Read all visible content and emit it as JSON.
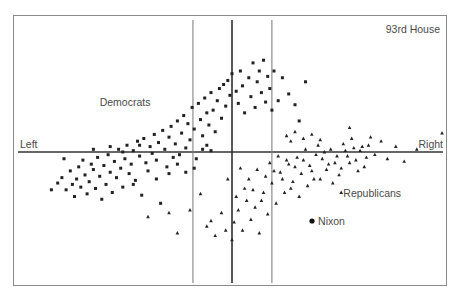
{
  "chart_data": {
    "type": "scatter",
    "title": "93rd House",
    "xlabel_left": "Left",
    "xlabel_right": "Right",
    "xlim": [
      -1,
      1
    ],
    "ylim": [
      -1,
      1
    ],
    "grid": false,
    "axis_lines": {
      "horizontal_y": 0,
      "vertical_center_x": 0,
      "vertical_guides_x": [
        -0.186,
        0.19
      ]
    },
    "annotations": [
      {
        "text": "Democrats",
        "x": -0.63,
        "y": 0.34
      },
      {
        "text": "Republicans",
        "x": 0.53,
        "y": -0.33
      },
      {
        "text": "Nixon",
        "x": 0.41,
        "y": -0.54
      }
    ],
    "special_points": [
      {
        "name": "Nixon",
        "x": 0.381,
        "y": -0.511,
        "marker": "circle"
      }
    ],
    "series": [
      {
        "name": "Democrats",
        "marker": "square",
        "points": [
          [
            -0.83,
            -0.23
          ],
          [
            -0.81,
            -0.19
          ],
          [
            -0.79,
            -0.28
          ],
          [
            -0.77,
            -0.14
          ],
          [
            -0.75,
            -0.33
          ],
          [
            -0.74,
            -0.2
          ],
          [
            -0.73,
            -0.11
          ],
          [
            -0.72,
            -0.26
          ],
          [
            -0.71,
            -0.06
          ],
          [
            -0.7,
            -0.17
          ],
          [
            -0.69,
            -0.31
          ],
          [
            -0.68,
            -0.22
          ],
          [
            -0.67,
            -0.09
          ],
          [
            -0.66,
            -0.13
          ],
          [
            -0.65,
            -0.27
          ],
          [
            -0.64,
            -0.04
          ],
          [
            -0.63,
            -0.18
          ],
          [
            -0.62,
            -0.35
          ],
          [
            -0.61,
            -0.1
          ],
          [
            -0.6,
            -0.24
          ],
          [
            -0.59,
            -0.02
          ],
          [
            -0.58,
            -0.15
          ],
          [
            -0.57,
            -0.3
          ],
          [
            -0.56,
            -0.07
          ],
          [
            -0.55,
            -0.19
          ],
          [
            -0.54,
            0.02
          ],
          [
            -0.53,
            -0.12
          ],
          [
            -0.52,
            -0.26
          ],
          [
            -0.51,
            -0.05
          ],
          [
            -0.5,
            0.05
          ],
          [
            -0.49,
            -0.16
          ],
          [
            -0.48,
            -0.09
          ],
          [
            -0.47,
            0.01
          ],
          [
            -0.46,
            -0.21
          ],
          [
            -0.45,
            0.08
          ],
          [
            -0.44,
            -0.03
          ],
          [
            -0.43,
            -0.32
          ],
          [
            -0.42,
            0.1
          ],
          [
            -0.41,
            -0.08
          ],
          [
            -0.4,
            -0.14
          ],
          [
            -0.39,
            0.04
          ],
          [
            -0.38,
            -0.01
          ],
          [
            -0.37,
            0.13
          ],
          [
            -0.36,
            -0.06
          ],
          [
            -0.35,
            0.07
          ],
          [
            -0.34,
            -0.38
          ],
          [
            -0.33,
            0.16
          ],
          [
            -0.32,
            0.02
          ],
          [
            -0.31,
            -0.11
          ],
          [
            -0.3,
            0.11
          ],
          [
            -0.29,
            0.19
          ],
          [
            -0.28,
            -0.04
          ],
          [
            -0.27,
            0.06
          ],
          [
            -0.26,
            0.23
          ],
          [
            -0.25,
            -0.02
          ],
          [
            -0.24,
            0.14
          ],
          [
            -0.23,
            0.27
          ],
          [
            -0.22,
            0.03
          ],
          [
            -0.21,
            0.21
          ],
          [
            -0.2,
            0.09
          ],
          [
            -0.19,
            0.33
          ],
          [
            -0.18,
            0.17
          ],
          [
            -0.17,
            -0.05
          ],
          [
            -0.16,
            0.36
          ],
          [
            -0.15,
            0.24
          ],
          [
            -0.14,
            0.12
          ],
          [
            -0.13,
            0.4
          ],
          [
            -0.12,
            0.29
          ],
          [
            -0.11,
            0.2
          ],
          [
            -0.1,
            0.44
          ],
          [
            -0.09,
            0.31
          ],
          [
            -0.08,
            0.15
          ],
          [
            -0.07,
            0.38
          ],
          [
            -0.06,
            0.47
          ],
          [
            -0.05,
            0.25
          ],
          [
            -0.04,
            0.5
          ],
          [
            -0.03,
            0.34
          ],
          [
            -0.02,
            0.53
          ],
          [
            -0.01,
            0.42
          ],
          [
            0.0,
            0.58
          ],
          [
            0.02,
            0.45
          ],
          [
            0.03,
            0.36
          ],
          [
            0.04,
            0.6
          ],
          [
            0.05,
            0.49
          ],
          [
            0.06,
            0.29
          ],
          [
            0.08,
            0.55
          ],
          [
            0.09,
            0.41
          ],
          [
            0.1,
            0.66
          ],
          [
            0.11,
            0.33
          ],
          [
            0.12,
            0.52
          ],
          [
            0.13,
            0.6
          ],
          [
            0.14,
            0.44
          ],
          [
            0.15,
            0.68
          ],
          [
            0.16,
            0.37
          ],
          [
            0.17,
            0.56
          ],
          [
            0.18,
            0.47
          ],
          [
            0.19,
            0.31
          ],
          [
            0.2,
            0.6
          ],
          [
            0.22,
            0.38
          ],
          [
            0.24,
            0.55
          ],
          [
            0.27,
            0.43
          ],
          [
            0.3,
            0.35
          ],
          [
            0.32,
            0.23
          ],
          [
            0.35,
            0.52
          ],
          [
            -0.86,
            -0.28
          ],
          [
            -0.8,
            -0.05
          ],
          [
            -0.76,
            -0.24
          ],
          [
            -0.66,
            0.02
          ],
          [
            -0.58,
            0.04
          ],
          [
            -0.52,
            0.0
          ],
          [
            -0.47,
            -0.24
          ],
          [
            -0.44,
            0.05
          ],
          [
            -0.36,
            -0.2
          ],
          [
            -0.3,
            -0.16
          ],
          [
            -0.26,
            -0.09
          ],
          [
            -0.22,
            -0.15
          ],
          [
            -0.18,
            -0.12
          ],
          [
            -0.14,
            0.02
          ],
          [
            -0.12,
            0.05
          ],
          [
            -0.1,
            0.01
          ]
        ]
      },
      {
        "name": "Republicans",
        "marker": "triangle",
        "points": [
          [
            -0.26,
            -0.6
          ],
          [
            -0.2,
            -0.43
          ],
          [
            -0.15,
            -0.31
          ],
          [
            -0.12,
            -0.55
          ],
          [
            -0.1,
            -0.51
          ],
          [
            -0.08,
            -0.62
          ],
          [
            -0.05,
            -0.45
          ],
          [
            -0.03,
            -0.58
          ],
          [
            0.01,
            -0.52
          ],
          [
            0.03,
            -0.43
          ],
          [
            0.05,
            -0.58
          ],
          [
            0.07,
            -0.36
          ],
          [
            0.09,
            -0.5
          ],
          [
            0.11,
            -0.41
          ],
          [
            0.13,
            -0.6
          ],
          [
            0.15,
            -0.3
          ],
          [
            0.17,
            -0.46
          ],
          [
            0.19,
            -0.23
          ],
          [
            0.21,
            -0.38
          ],
          [
            0.23,
            -0.15
          ],
          [
            0.25,
            -0.3
          ],
          [
            0.27,
            -0.09
          ],
          [
            0.29,
            -0.22
          ],
          [
            0.31,
            -0.04
          ],
          [
            0.33,
            -0.16
          ],
          [
            0.35,
            0.02
          ],
          [
            0.37,
            -0.1
          ],
          [
            0.39,
            -0.2
          ],
          [
            0.41,
            0.05
          ],
          [
            0.43,
            -0.05
          ],
          [
            0.45,
            -0.13
          ],
          [
            0.47,
            0.02
          ],
          [
            0.49,
            -0.08
          ],
          [
            0.51,
            -0.17
          ],
          [
            0.53,
            0.06
          ],
          [
            0.55,
            -0.03
          ],
          [
            0.57,
            0.1
          ],
          [
            0.59,
            -0.06
          ],
          [
            0.61,
            0.01
          ],
          [
            0.63,
            -0.11
          ],
          [
            0.65,
            0.05
          ],
          [
            0.68,
            -0.02
          ],
          [
            0.71,
            0.08
          ],
          [
            0.74,
            -0.05
          ],
          [
            0.78,
            0.04
          ],
          [
            0.82,
            -0.07
          ],
          [
            0.88,
            0.02
          ],
          [
            1.0,
            0.14
          ],
          [
            0.18,
            -0.08
          ],
          [
            0.2,
            -0.14
          ],
          [
            0.22,
            -0.03
          ],
          [
            0.24,
            -0.2
          ],
          [
            0.26,
            -0.06
          ],
          [
            0.28,
            -0.27
          ],
          [
            0.3,
            -0.11
          ],
          [
            0.32,
            -0.33
          ],
          [
            0.34,
            -0.06
          ],
          [
            0.36,
            -0.25
          ],
          [
            0.38,
            -0.14
          ],
          [
            0.4,
            -0.02
          ],
          [
            0.42,
            -0.2
          ],
          [
            0.44,
            0.0
          ],
          [
            0.46,
            -0.09
          ],
          [
            0.48,
            -0.23
          ],
          [
            0.5,
            -0.03
          ],
          [
            0.52,
            -0.12
          ],
          [
            0.54,
            0.01
          ],
          [
            0.56,
            -0.08
          ],
          [
            0.58,
            0.03
          ],
          [
            0.6,
            -0.14
          ],
          [
            0.62,
            0.04
          ],
          [
            0.64,
            -0.04
          ],
          [
            0.08,
            -0.2
          ],
          [
            0.1,
            -0.28
          ],
          [
            0.12,
            -0.13
          ],
          [
            0.14,
            -0.36
          ],
          [
            0.16,
            -0.18
          ],
          [
            0.06,
            -0.27
          ],
          [
            0.04,
            -0.12
          ],
          [
            0.02,
            -0.33
          ],
          [
            0.26,
            0.12
          ],
          [
            0.28,
            0.08
          ],
          [
            0.3,
            0.15
          ],
          [
            0.34,
            0.1
          ],
          [
            0.38,
            0.13
          ],
          [
            0.42,
            0.09
          ],
          [
            0.56,
            0.18
          ],
          [
            0.52,
            -0.3
          ],
          [
            -0.3,
            -0.45
          ],
          [
            -0.4,
            -0.48
          ],
          [
            -0.02,
            -0.2
          ],
          [
            0.0,
            -0.65
          ],
          [
            0.66,
            0.11
          ]
        ]
      }
    ]
  }
}
